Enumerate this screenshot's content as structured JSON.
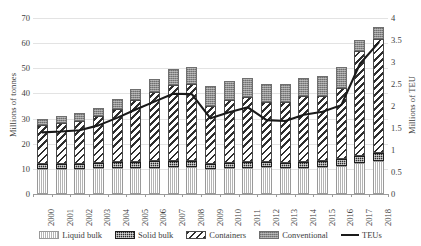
{
  "chart_data": {
    "type": "bar",
    "title": "",
    "subtitle": "",
    "stacked": true,
    "xlabel": "",
    "ylabel": "Millions of tonnes",
    "y2label": "Millions of TEU",
    "ylim": [
      0,
      70
    ],
    "y2lim": [
      0,
      4
    ],
    "grid": true,
    "legend_position": "bottom",
    "categories": [
      "2000",
      "2001",
      "2002",
      "2003",
      "2004",
      "2005",
      "2006",
      "2007",
      "2008",
      "2009",
      "2010",
      "2011",
      "2012",
      "2013",
      "2014",
      "2015",
      "2016",
      "2017",
      "2018"
    ],
    "yticks": [
      0,
      10,
      20,
      30,
      40,
      50,
      60,
      70
    ],
    "yticklabels": [
      "0",
      "10",
      "20",
      "30",
      "40",
      "50",
      "60",
      "70"
    ],
    "y2ticks": [
      0,
      0.5,
      1,
      1.5,
      2,
      2.5,
      3,
      3.5,
      4
    ],
    "y2ticklabels": [
      "0",
      "0.5",
      "1",
      "1.5",
      "2",
      "2.5",
      "3",
      "3.5",
      "4"
    ],
    "series": [
      {
        "name": "Liquid bulk",
        "axis": "left",
        "kind": "bar",
        "values": [
          9.8,
          9.9,
          10.0,
          10.2,
          10.3,
          10.3,
          10.5,
          10.6,
          10.8,
          10.0,
          10.2,
          10.4,
          10.6,
          10.4,
          10.5,
          10.7,
          11.2,
          12.3,
          13.0
        ]
      },
      {
        "name": "Solid bulk",
        "axis": "left",
        "kind": "bar",
        "values": [
          2.0,
          2.0,
          2.0,
          2.1,
          2.3,
          2.4,
          2.5,
          2.4,
          2.3,
          2.0,
          2.1,
          2.2,
          2.2,
          2.1,
          2.2,
          2.3,
          2.6,
          2.9,
          3.2
        ]
      },
      {
        "name": "Containers",
        "axis": "left",
        "kind": "bar",
        "values": [
          15.6,
          16.3,
          17.0,
          18.6,
          21.3,
          24.6,
          27.4,
          30.5,
          30.5,
          23.2,
          25.0,
          25.9,
          23.8,
          24.0,
          26.1,
          26.0,
          28.4,
          41.6,
          45.4
        ]
      },
      {
        "name": "Conventional",
        "axis": "left",
        "kind": "bar",
        "values": [
          2.3,
          2.9,
          3.2,
          3.4,
          3.9,
          4.6,
          5.4,
          6.4,
          6.8,
          7.6,
          7.8,
          7.7,
          7.3,
          7.3,
          7.5,
          8.1,
          8.3,
          4.5,
          4.8
        ]
      },
      {
        "name": "TEUs",
        "axis": "right",
        "kind": "line",
        "values": [
          1.4,
          1.42,
          1.45,
          1.56,
          1.73,
          1.92,
          2.1,
          2.28,
          2.27,
          1.72,
          1.86,
          1.97,
          1.68,
          1.66,
          1.8,
          1.87,
          2.02,
          2.96,
          3.44
        ]
      }
    ],
    "legend": [
      {
        "label": "Liquid bulk",
        "marker": "pattern-vertical-lines"
      },
      {
        "label": "Solid bulk",
        "marker": "pattern-dark-checker"
      },
      {
        "label": "Containers",
        "marker": "pattern-diagonal-stripes"
      },
      {
        "label": "Conventional",
        "marker": "pattern-grey-checker"
      },
      {
        "label": "TEUs",
        "marker": "line-solid-black"
      }
    ],
    "colors": {
      "liquid_bulk": "#c9c9c9",
      "solid_bulk": "#2a2a2a",
      "containers": "#2e2e2e",
      "conventional": "#8d8d8d",
      "teu_line": "#1a1a1a",
      "gridline": "#e3e3e3",
      "axis": "#9b9b9b",
      "text": "#3d3d3d"
    }
  }
}
